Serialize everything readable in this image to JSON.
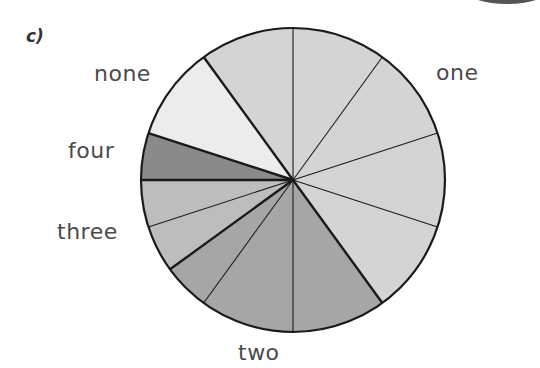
{
  "part_label": "c)",
  "chart_data": {
    "type": "pie",
    "title": "",
    "start_angle_deg": 0,
    "direction": "clockwise",
    "total_divisions": 20,
    "categories": [
      "one",
      "two",
      "three",
      "four",
      "none"
    ],
    "values": [
      10,
      5,
      2,
      1,
      2
    ],
    "degrees": [
      180,
      90,
      36,
      18,
      36
    ],
    "colors": [
      "#d4d4d4",
      "#a6a6a6",
      "#bdbdbd",
      "#8a8a8a",
      "#ececec"
    ],
    "slices": [
      {
        "category": "one",
        "start": 324,
        "end": 360
      },
      {
        "category": "one",
        "start": 0,
        "end": 36
      },
      {
        "category": "one",
        "start": 36,
        "end": 72
      },
      {
        "category": "one",
        "start": 72,
        "end": 108
      },
      {
        "category": "one",
        "start": 108,
        "end": 144
      },
      {
        "category": "two",
        "start": 144,
        "end": 180
      },
      {
        "category": "two",
        "start": 180,
        "end": 216
      },
      {
        "category": "two",
        "start": 216,
        "end": 234
      },
      {
        "category": "three",
        "start": 234,
        "end": 252
      },
      {
        "category": "three",
        "start": 252,
        "end": 270
      },
      {
        "category": "four",
        "start": 270,
        "end": 288
      },
      {
        "category": "none",
        "start": 288,
        "end": 324
      }
    ],
    "thin_dividers_deg": [
      0,
      36,
      72,
      108,
      180,
      216,
      252
    ],
    "thick_dividers_deg": [
      144,
      234,
      270,
      288,
      324
    ],
    "legend": "labels placed outside slices"
  },
  "labels": {
    "none": "none",
    "one": "one",
    "four": "four",
    "three": "three",
    "two": "two"
  }
}
